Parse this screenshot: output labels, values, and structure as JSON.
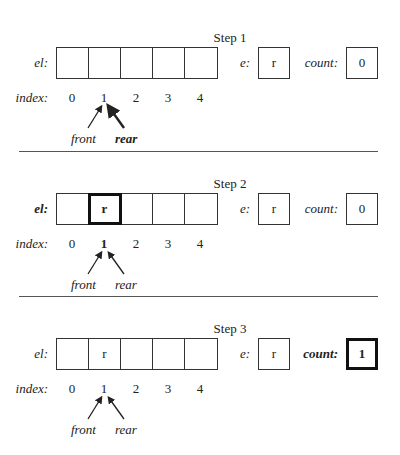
{
  "steps": [
    {
      "title": "Step 1",
      "el_label": "el:",
      "el_label_bold": false,
      "cells": [
        "",
        "",
        "",
        "",
        ""
      ],
      "highlight_cell": null,
      "e_label": "e:",
      "e_value": "r",
      "count_label": "count:",
      "count_value": "0",
      "count_highlight": false,
      "index_label": "index:",
      "indices": [
        "0",
        "1",
        "2",
        "3",
        "4"
      ],
      "bold_index": null,
      "front_label": "front",
      "rear_label": "rear",
      "front_index": 1,
      "rear_index": 1,
      "front_bold": false,
      "rear_bold": true
    },
    {
      "title": "Step 2",
      "el_label": "el:",
      "el_label_bold": true,
      "cells": [
        "",
        "r",
        "",
        "",
        ""
      ],
      "highlight_cell": 1,
      "e_label": "e:",
      "e_value": "r",
      "count_label": "count:",
      "count_value": "0",
      "count_highlight": false,
      "index_label": "index:",
      "indices": [
        "0",
        "1",
        "2",
        "3",
        "4"
      ],
      "bold_index": 1,
      "front_label": "front",
      "rear_label": "rear",
      "front_index": 1,
      "rear_index": 1,
      "front_bold": false,
      "rear_bold": false
    },
    {
      "title": "Step 3",
      "el_label": "el:",
      "el_label_bold": false,
      "cells": [
        "",
        "r",
        "",
        "",
        ""
      ],
      "highlight_cell": null,
      "e_label": "e:",
      "e_value": "r",
      "count_label": "count:",
      "count_value": "1",
      "count_highlight": true,
      "index_label": "index:",
      "indices": [
        "0",
        "1",
        "2",
        "3",
        "4"
      ],
      "bold_index": null,
      "front_label": "front",
      "rear_label": "rear",
      "front_index": 1,
      "rear_index": 1,
      "front_bold": false,
      "rear_bold": false
    }
  ]
}
